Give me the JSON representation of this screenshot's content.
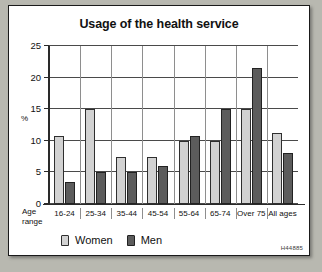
{
  "figure": {
    "reference_code": "H44885",
    "axis_origin_label": "Age range",
    "age_range_line1": "Age",
    "age_range_line2": "range"
  },
  "chart_data": {
    "type": "bar",
    "title": "Usage of the health service",
    "xlabel": "Age range",
    "ylabel": "%",
    "ylim": [
      0,
      25
    ],
    "yticks": [
      0,
      5,
      10,
      15,
      20,
      25
    ],
    "grid": true,
    "legend_position": "bottom-left",
    "categories": [
      "16-24",
      "25-34",
      "35-44",
      "45-54",
      "55-64",
      "65-74",
      "Over 75",
      "All ages"
    ],
    "series": [
      {
        "name": "Women",
        "color": "#d2d2d2",
        "values": [
          10.7,
          15,
          7.5,
          7.5,
          10,
          10,
          15,
          11.3
        ]
      },
      {
        "name": "Men",
        "color": "#5c5c5c",
        "values": [
          3.5,
          5,
          5,
          6,
          10.7,
          15,
          21.5,
          8
        ]
      }
    ]
  }
}
